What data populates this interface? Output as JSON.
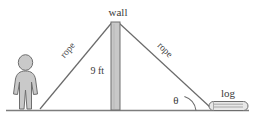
{
  "diagram": {
    "labels": {
      "wall": "wall",
      "rope_left": "rope",
      "rope_right": "rope",
      "height": "9 ft",
      "angle": "θ",
      "log": "log"
    },
    "colors": {
      "stroke": "#666666",
      "text": "#3a3a3a",
      "wall_fill": "#c8c8c8",
      "person_fill": "#c9c9c9",
      "log_fill": "#e3e3e3",
      "ground": "#808080",
      "background": "#ffffff"
    },
    "geometry": {
      "ground_y": 110,
      "ground_x_start": 6,
      "ground_x_end": 249,
      "wall_top_y": 22,
      "wall_x": 111,
      "wall_width": 9,
      "person_base_x": 28,
      "rope_left_anchor_x": 40,
      "rope_right_anchor_x": 211,
      "angle_value_label": "θ"
    }
  }
}
